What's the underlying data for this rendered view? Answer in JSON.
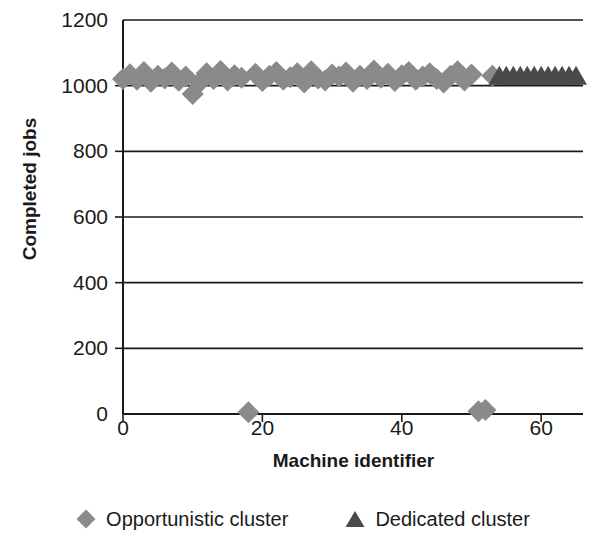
{
  "chart_data": {
    "type": "scatter",
    "title": "",
    "xlabel": "Machine identifier",
    "ylabel": "Completed jobs",
    "xlim": [
      0,
      66
    ],
    "ylim": [
      0,
      1200
    ],
    "xticks": [
      0,
      20,
      40,
      60
    ],
    "yticks": [
      0,
      200,
      400,
      600,
      800,
      1000,
      1200
    ],
    "grid": true,
    "grid_axis": "y",
    "legend_position": "bottom",
    "series": [
      {
        "name": "Opportunistic cluster",
        "marker": "diamond",
        "color": "#8a8a8a",
        "x": [
          0,
          1,
          2,
          3,
          4,
          5,
          6,
          7,
          8,
          9,
          10,
          11,
          12,
          13,
          14,
          15,
          16,
          17,
          18,
          19,
          20,
          21,
          22,
          23,
          24,
          25,
          26,
          27,
          28,
          29,
          30,
          31,
          32,
          33,
          34,
          35,
          36,
          37,
          38,
          39,
          40,
          41,
          42,
          43,
          44,
          45,
          46,
          47,
          48,
          49,
          50,
          51,
          52,
          53
        ],
        "values": [
          1020,
          1035,
          1018,
          1042,
          1012,
          1030,
          1022,
          1040,
          1015,
          1028,
          975,
          1010,
          1038,
          1020,
          1045,
          1016,
          1032,
          1024,
          5,
          1036,
          1014,
          1030,
          1042,
          1018,
          1026,
          1038,
          1010,
          1044,
          1022,
          1016,
          1034,
          1028,
          1040,
          1012,
          1030,
          1020,
          1046,
          1024,
          1036,
          1014,
          1032,
          1042,
          1018,
          1028,
          1038,
          1020,
          1010,
          1030,
          1044,
          1016,
          1034,
          8,
          12,
          1030
        ]
      },
      {
        "name": "Dedicated cluster",
        "marker": "triangle",
        "color": "#4a4a4a",
        "x": [
          54,
          55,
          56,
          57,
          58,
          59,
          60,
          61,
          62,
          63,
          64,
          65
        ],
        "values": [
          1030,
          1030,
          1030,
          1030,
          1030,
          1030,
          1030,
          1030,
          1030,
          1030,
          1030,
          1030
        ]
      }
    ]
  },
  "axis": {
    "y_title": "Completed jobs",
    "x_title": "Machine identifier",
    "y_tick_labels": [
      "1200",
      "1000",
      "800",
      "600",
      "400",
      "200",
      "0"
    ],
    "x_tick_labels": [
      "0",
      "20",
      "40",
      "60"
    ]
  },
  "legend": {
    "items": [
      {
        "label": "Opportunistic cluster",
        "marker": "diamond-marker-icon",
        "color": "#8a8a8a"
      },
      {
        "label": "Dedicated cluster",
        "marker": "triangle-marker-icon",
        "color": "#4a4a4a"
      }
    ]
  },
  "colors": {
    "axis": "#1a1a1a",
    "grid": "#1a1a1a",
    "background": "#ffffff",
    "opportunistic": "#8a8a8a",
    "dedicated": "#4a4a4a"
  }
}
